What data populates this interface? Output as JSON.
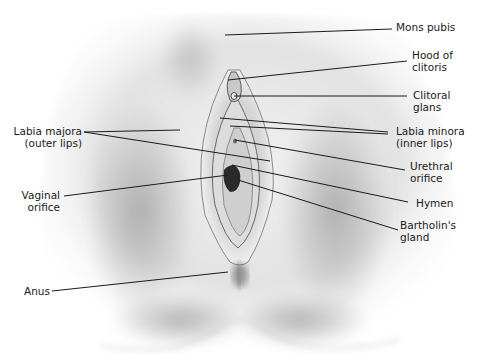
{
  "diagram": {
    "type": "anatomical-illustration",
    "colors": {
      "background": "#ffffff",
      "leader_line": "#1a1a1a",
      "label_text": "#1a1a1a",
      "skin_light": "#e6e6e6",
      "skin_shadow": "#9a9a9a"
    },
    "labels": {
      "mons_pubis": {
        "line1": "Mons pubis"
      },
      "hood_of_clitoris": {
        "line1": "Hood of",
        "line2": "clitoris"
      },
      "clitoral_glans": {
        "line1": "Clitoral",
        "line2": "glans"
      },
      "labia_minora": {
        "line1": "Labia minora",
        "line2": "(inner lips)"
      },
      "urethral_orifice": {
        "line1": "Urethral",
        "line2": "orifice"
      },
      "hymen": {
        "line1": "Hymen"
      },
      "bartholins_gland": {
        "line1": "Bartholin's",
        "line2": "gland"
      },
      "labia_majora": {
        "line1": "Labia majora",
        "line2": "(outer lips)"
      },
      "vaginal_orifice": {
        "line1": "Vaginal",
        "line2": "orifice"
      },
      "anus": {
        "line1": "Anus"
      }
    }
  }
}
